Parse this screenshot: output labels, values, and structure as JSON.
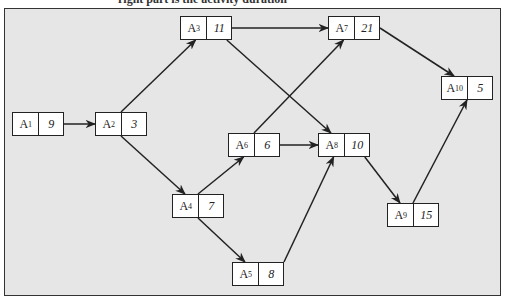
{
  "caption": "right part is the activity duration",
  "nodes": [
    {
      "id": "A1",
      "label_base": "A",
      "label_sub": "1",
      "duration": "9"
    },
    {
      "id": "A2",
      "label_base": "A",
      "label_sub": "2",
      "duration": "3"
    },
    {
      "id": "A3",
      "label_base": "A",
      "label_sub": "3",
      "duration": "11"
    },
    {
      "id": "A4",
      "label_base": "A",
      "label_sub": "4",
      "duration": "7"
    },
    {
      "id": "A5",
      "label_base": "A",
      "label_sub": "5",
      "duration": "8"
    },
    {
      "id": "A6",
      "label_base": "A",
      "label_sub": "6",
      "duration": "6"
    },
    {
      "id": "A7",
      "label_base": "A",
      "label_sub": "7",
      "duration": "21"
    },
    {
      "id": "A8",
      "label_base": "A",
      "label_sub": "8",
      "duration": "10"
    },
    {
      "id": "A9",
      "label_base": "A",
      "label_sub": "9",
      "duration": "15"
    },
    {
      "id": "A10",
      "label_base": "A",
      "label_sub": "10",
      "duration": "5"
    }
  ],
  "edges": [
    {
      "from": "A1",
      "to": "A2"
    },
    {
      "from": "A2",
      "to": "A3"
    },
    {
      "from": "A2",
      "to": "A4"
    },
    {
      "from": "A3",
      "to": "A7"
    },
    {
      "from": "A3",
      "to": "A8"
    },
    {
      "from": "A4",
      "to": "A6"
    },
    {
      "from": "A4",
      "to": "A5"
    },
    {
      "from": "A6",
      "to": "A7"
    },
    {
      "from": "A6",
      "to": "A8"
    },
    {
      "from": "A5",
      "to": "A8"
    },
    {
      "from": "A7",
      "to": "A10"
    },
    {
      "from": "A8",
      "to": "A9"
    },
    {
      "from": "A9",
      "to": "A10"
    }
  ]
}
